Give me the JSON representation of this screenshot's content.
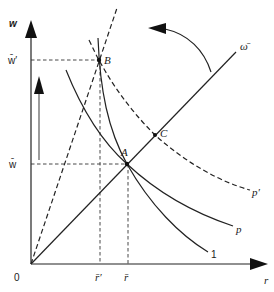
{
  "diagram": {
    "axes": {
      "y_label": "w",
      "x_label": "r",
      "origin_label": "0",
      "y_ticks": [
        {
          "label": "w̄′",
          "y": 60
        },
        {
          "label": "w̄",
          "y": 164
        }
      ],
      "x_ticks": [
        {
          "label": "r̄′",
          "x": 100
        },
        {
          "label": "r̄",
          "x": 128
        }
      ]
    },
    "points": {
      "A": {
        "label": "A"
      },
      "B": {
        "label": "B"
      },
      "C": {
        "label": "C"
      }
    },
    "curves": {
      "omega_bar": {
        "label": "ω̄",
        "style": "solid"
      },
      "curve_1": {
        "label": "1",
        "style": "solid"
      },
      "curve_p": {
        "label": "p",
        "style": "solid"
      },
      "curve_p_prime": {
        "label": "p′",
        "style": "dashed"
      },
      "steep_ray": {
        "style": "dashed"
      }
    },
    "arrows": {
      "rotation_arrow": "counter-clockwise rotation of ω̄",
      "wage_increase_arrow": "upward shift of w"
    }
  }
}
